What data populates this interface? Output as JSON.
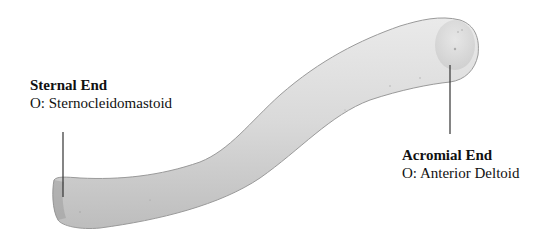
{
  "figure": {
    "bone_color": "#d6d6d6",
    "line_color": "#333333"
  },
  "labels": {
    "sternal": {
      "title": "Sternal End",
      "origin": "O: Sternocleidomastoid"
    },
    "acromial": {
      "title": "Acromial End",
      "origin": "O: Anterior Deltoid"
    }
  }
}
